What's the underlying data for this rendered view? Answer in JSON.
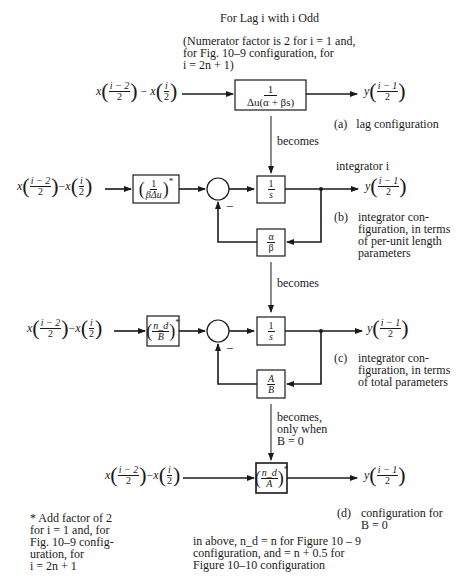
{
  "header": {
    "title": "For Lag i with i Odd",
    "note": "(Numerator factor is 2 for i = 1 and,\nfor Fig. 10–9 configuration, for\ni = 2n + 1)"
  },
  "signals": {
    "input_a": {
      "x1": "x",
      "num1": "i − 2",
      "den1": "2",
      "minus": "−",
      "x2": "x",
      "num2": "i",
      "den2": "2"
    },
    "output": {
      "y": "y",
      "num": "i − 1",
      "den": "2"
    }
  },
  "panel_a": {
    "block": {
      "num": "1",
      "den": "Δu(α + βs)"
    },
    "caption_tag": "(a)",
    "caption": "lag configuration"
  },
  "arrow_ab": {
    "label": "becomes"
  },
  "panel_b": {
    "title": "integrator i",
    "gain_block": {
      "num": "1",
      "den": "βΔu",
      "star": "*"
    },
    "integrator_block": {
      "num": "1",
      "den": "s"
    },
    "feedback_block": {
      "num": "α",
      "den": "β"
    },
    "feedback_sign": "−",
    "caption_tag": "(b)",
    "caption": "integrator con-\nfiguration, in terms\nof per-unit length\nparameters"
  },
  "arrow_bc": {
    "label": "becomes"
  },
  "panel_c": {
    "gain_block": {
      "num": "n_d",
      "den": "B",
      "star": "*"
    },
    "integrator_block": {
      "num": "1",
      "den": "s"
    },
    "feedback_block": {
      "num": "A",
      "den": "B"
    },
    "feedback_sign": "−",
    "caption_tag": "(c)",
    "caption": "integrator con-\nfiguration, in terms\nof total parameters"
  },
  "arrow_cd": {
    "label": "becomes,\nonly when\n  B = 0"
  },
  "panel_d": {
    "gain_block": {
      "num": "n_d",
      "den": "A",
      "star": "*"
    },
    "caption_tag": "(d)",
    "caption": "configuration for\nB = 0"
  },
  "footnote": {
    "text": "* Add factor of 2\nfor i = 1 and, for\nFig. 10–9 config-\nuration, for\ni = 2n + 1"
  },
  "bottom_note": {
    "text": "in above, n_d = n for Figure 10 – 9\nconfiguration, and = n + 0.5 for\nFigure 10–10 configuration"
  },
  "colors": {
    "ink": "#1a1a1a",
    "background": "#ffffff"
  }
}
